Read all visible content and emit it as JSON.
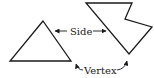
{
  "diagram": {
    "labels": {
      "side": "Side",
      "vertex": "Vertex"
    },
    "shapes": [
      {
        "name": "triangle",
        "points": "43,21 10,61 71,61"
      },
      {
        "name": "concave-hexagon",
        "points": "86,3 132,3 125,19 152,27 129,54"
      }
    ],
    "colors": {
      "stroke": "#1a1a1a",
      "background": "#ffffff"
    }
  }
}
